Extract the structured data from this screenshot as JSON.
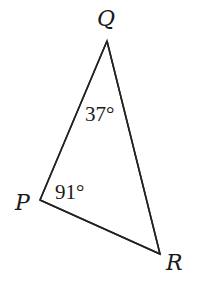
{
  "diagram": {
    "type": "triangle",
    "vertices": {
      "Q": {
        "label": "Q",
        "x": 107,
        "y": 41
      },
      "P": {
        "label": "P",
        "x": 40,
        "y": 200
      },
      "R": {
        "label": "R",
        "x": 160,
        "y": 254
      }
    },
    "angles": {
      "Q": {
        "label": "37°",
        "value": 37
      },
      "P": {
        "label": "91°",
        "value": 91
      }
    },
    "colors": {
      "line": "#222222",
      "text": "#1a1a1a",
      "background": "#ffffff"
    }
  }
}
